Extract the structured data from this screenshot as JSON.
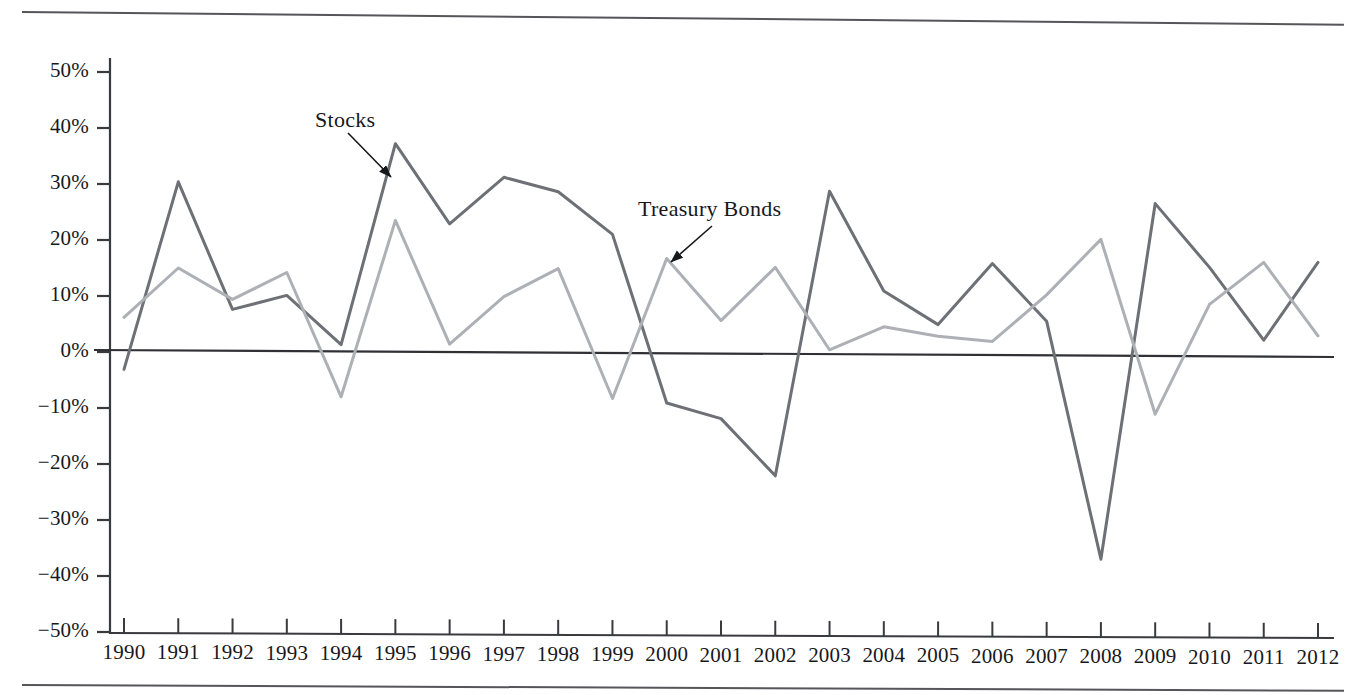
{
  "figure": {
    "has_top_rule": true,
    "has_bottom_rule": true,
    "background_color": "#ffffff",
    "rule_color": "#55565a"
  },
  "chart_data": {
    "type": "line",
    "title": "",
    "subtitle": "",
    "xlabel": "",
    "ylabel": "",
    "grid": false,
    "legend_position": "inline-annotations",
    "x": [
      1990,
      1991,
      1992,
      1993,
      1994,
      1995,
      1996,
      1997,
      1998,
      1999,
      2000,
      2001,
      2002,
      2003,
      2004,
      2005,
      2006,
      2007,
      2008,
      2009,
      2010,
      2011,
      2012
    ],
    "categories": [
      "1990",
      "1991",
      "1992",
      "1993",
      "1994",
      "1995",
      "1996",
      "1997",
      "1998",
      "1999",
      "2000",
      "2001",
      "2002",
      "2003",
      "2004",
      "2005",
      "2006",
      "2007",
      "2008",
      "2009",
      "2010",
      "2011",
      "2012"
    ],
    "ylim": [
      -50,
      50
    ],
    "xlim": [
      1990,
      2012
    ],
    "ytick_labels": [
      "50%",
      "40%",
      "30%",
      "20%",
      "10%",
      "0%",
      "−10%",
      "−20%",
      "−30%",
      "−40%",
      "−50%"
    ],
    "ytick_values": [
      50,
      40,
      30,
      20,
      10,
      0,
      -10,
      -20,
      -30,
      -40,
      -50
    ],
    "zero_line": 0,
    "series": [
      {
        "name": "Stocks",
        "color": "#6e7076",
        "values": [
          -3.1,
          30.4,
          7.6,
          10.1,
          1.3,
          37.2,
          22.9,
          31.2,
          28.6,
          21.0,
          -9.1,
          -11.9,
          -22.1,
          28.7,
          10.9,
          4.9,
          15.8,
          5.5,
          -37.0,
          26.5,
          15.1,
          2.1,
          16.0
        ]
      },
      {
        "name": "Treasury Bonds",
        "color": "#aeb0b5",
        "values": [
          6.2,
          15.0,
          9.4,
          14.2,
          -8.0,
          23.5,
          1.4,
          9.9,
          14.9,
          -8.3,
          16.7,
          5.6,
          15.1,
          0.4,
          4.5,
          2.8,
          1.9,
          10.2,
          20.1,
          -11.1,
          8.5,
          16.0,
          2.9
        ]
      }
    ],
    "annotations": [
      {
        "text": "Stocks",
        "target_series": "Stocks",
        "target_year": 1995,
        "label_x": 315,
        "label_y": 107,
        "arrow_from_x": 348,
        "arrow_from_y": 133,
        "arrow_to_x": 391,
        "arrow_to_y": 177
      },
      {
        "text": "Treasury Bonds",
        "target_series": "Treasury Bonds",
        "target_year": 2000,
        "label_x": 638,
        "label_y": 196,
        "arrow_from_x": 712,
        "arrow_from_y": 226,
        "arrow_to_x": 671,
        "arrow_to_y": 262
      }
    ]
  },
  "axes": {
    "x_tick_labels": [
      "1990",
      "1991",
      "1992",
      "1993",
      "1994",
      "1995",
      "1996",
      "1997",
      "1998",
      "1999",
      "2000",
      "2001",
      "2002",
      "2003",
      "2004",
      "2005",
      "2006",
      "2007",
      "2008",
      "2009",
      "2010",
      "2011",
      "2012"
    ],
    "y_tick_labels": [
      "50%",
      "40%",
      "30%",
      "20%",
      "10%",
      "0%",
      "−10%",
      "−20%",
      "−30%",
      "−40%",
      "−50%"
    ],
    "axis_color": "#3a3b3f"
  }
}
